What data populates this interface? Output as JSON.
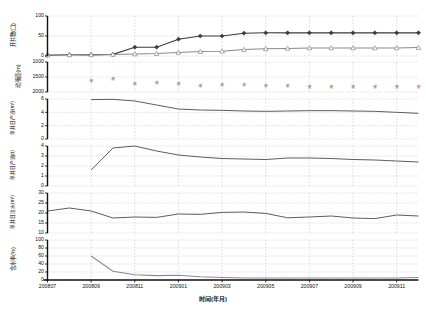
{
  "figure": {
    "background": "#ffffff",
    "xlabel": "时间(年月)",
    "x_categories": [
      "200807",
      "200808",
      "200809",
      "200810",
      "200811",
      "200812",
      "200901",
      "200902",
      "200903",
      "200904",
      "200905",
      "200906",
      "200907",
      "200908",
      "200909",
      "200910",
      "200911",
      "200912"
    ],
    "x_tick_labels": [
      "200807",
      "200809",
      "200811",
      "200901",
      "200903",
      "200905",
      "200907",
      "200909",
      "200911"
    ],
    "colors": {
      "series_dark": "#3a3a3a",
      "series_light": "#8a8a8a",
      "grid": "#b9b9c9",
      "axis": "#111111"
    }
  },
  "chart_data": [
    {
      "type": "line",
      "panel_index": 0,
      "ylabel": "开井数(口)",
      "ylim": [
        0,
        100
      ],
      "yticks": [
        0,
        50,
        100
      ],
      "ytick_labels": [
        "0",
        "50",
        "100"
      ],
      "inverted": false,
      "grid": true,
      "x": [
        "200807",
        "200808",
        "200809",
        "200810",
        "200811",
        "200812",
        "200901",
        "200902",
        "200903",
        "200904",
        "200905",
        "200906",
        "200907",
        "200908",
        "200909",
        "200910",
        "200911",
        "200912"
      ],
      "series": [
        {
          "name": "采油井数",
          "marker": "diamond-filled",
          "color": "#3a3a3a",
          "values": [
            2,
            3,
            3,
            4,
            22,
            22,
            42,
            50,
            50,
            57,
            58,
            58,
            58,
            58,
            58,
            58,
            58,
            58
          ]
        },
        {
          "name": "注水井数",
          "marker": "triangle-open",
          "color": "#8a8a8a",
          "values": [
            2,
            3,
            3,
            4,
            5,
            6,
            9,
            11,
            12,
            16,
            18,
            19,
            20,
            20,
            20,
            20,
            20,
            21
          ]
        }
      ]
    },
    {
      "type": "scatter",
      "panel_index": 1,
      "ylabel": "动液面(m)",
      "ylim": [
        1000,
        2000
      ],
      "yticks": [
        1000,
        1500,
        2000
      ],
      "ytick_labels": [
        "1000",
        "1500",
        "2000"
      ],
      "inverted": true,
      "grid": true,
      "x": [
        "200809",
        "200810",
        "200811",
        "200812",
        "200901",
        "200902",
        "200903",
        "200904",
        "200905",
        "200906",
        "200907",
        "200908",
        "200909",
        "200910",
        "200911",
        "200912"
      ],
      "series": [
        {
          "name": "动液面",
          "marker": "asterisk",
          "color": "#6b6b7d",
          "values": [
            1620,
            1560,
            1720,
            1700,
            1710,
            1780,
            1760,
            1755,
            1790,
            1795,
            1810,
            1830,
            1825,
            1815,
            1820,
            1830
          ]
        }
      ]
    },
    {
      "type": "line",
      "panel_index": 2,
      "ylabel": "单井日产液(m³)",
      "ylim": [
        0,
        6
      ],
      "yticks": [
        0,
        2,
        4,
        6
      ],
      "ytick_labels": [
        "0",
        "2",
        "4",
        "6"
      ],
      "inverted": false,
      "grid": true,
      "x": [
        "200809",
        "200810",
        "200811",
        "200812",
        "200901",
        "200902",
        "200903",
        "200904",
        "200905",
        "200906",
        "200907",
        "200908",
        "200909",
        "200910",
        "200911",
        "200912"
      ],
      "series": [
        {
          "name": "单井日产液",
          "marker": "none",
          "color": "#5d5d5d",
          "values": [
            5.9,
            5.95,
            5.7,
            5.1,
            4.5,
            4.35,
            4.3,
            4.2,
            4.15,
            4.2,
            4.25,
            4.25,
            4.2,
            4.15,
            4.0,
            3.85
          ]
        }
      ]
    },
    {
      "type": "line",
      "panel_index": 3,
      "ylabel": "单井日产油(t)",
      "ylim": [
        0,
        4
      ],
      "yticks": [
        0,
        1,
        2,
        3,
        4
      ],
      "ytick_labels": [
        "0",
        "1",
        "2",
        "3",
        "4"
      ],
      "inverted": false,
      "grid": true,
      "x": [
        "200809",
        "200810",
        "200811",
        "200812",
        "200901",
        "200902",
        "200903",
        "200904",
        "200905",
        "200906",
        "200907",
        "200908",
        "200909",
        "200910",
        "200911",
        "200912"
      ],
      "series": [
        {
          "name": "单井日产油",
          "marker": "none",
          "color": "#5d5d5d",
          "values": [
            1.6,
            3.8,
            4.0,
            3.5,
            3.1,
            2.9,
            2.75,
            2.7,
            2.65,
            2.8,
            2.8,
            2.75,
            2.65,
            2.6,
            2.5,
            2.4
          ]
        }
      ]
    },
    {
      "type": "line",
      "panel_index": 4,
      "ylabel": "单井日注水(m³)",
      "ylim": [
        10,
        30
      ],
      "yticks": [
        10,
        15,
        20,
        25,
        30
      ],
      "ytick_labels": [
        "10",
        "15",
        "20",
        "25",
        "30"
      ],
      "inverted": false,
      "grid": true,
      "x": [
        "200807",
        "200808",
        "200809",
        "200810",
        "200811",
        "200812",
        "200901",
        "200902",
        "200903",
        "200904",
        "200905",
        "200906",
        "200907",
        "200908",
        "200909",
        "200910",
        "200911",
        "200912"
      ],
      "series": [
        {
          "name": "单井日注水",
          "marker": "none",
          "color": "#5d5d5d",
          "values": [
            21,
            22.5,
            21,
            17.5,
            18,
            17.8,
            19.5,
            19.3,
            20.3,
            20.5,
            19.8,
            17.6,
            18,
            18.5,
            17.5,
            17.2,
            19,
            18.5
          ]
        }
      ]
    },
    {
      "type": "line",
      "panel_index": 5,
      "ylabel": "含水率(%)",
      "ylim": [
        0,
        100
      ],
      "yticks": [
        0,
        20,
        40,
        60,
        80,
        100
      ],
      "ytick_labels": [
        "0",
        "20",
        "40",
        "60",
        "80",
        "100"
      ],
      "inverted": false,
      "grid": true,
      "x": [
        "200809",
        "200810",
        "200811",
        "200812",
        "200901",
        "200902",
        "200903",
        "200904",
        "200905",
        "200906",
        "200907",
        "200908",
        "200909",
        "200910",
        "200911",
        "200912"
      ],
      "series": [
        {
          "name": "含水率",
          "marker": "none",
          "color": "#9a9a9a",
          "values": [
            60,
            22,
            13,
            11,
            12,
            8,
            6,
            5,
            5,
            5,
            5,
            5,
            5,
            5,
            5,
            6
          ]
        }
      ]
    }
  ]
}
